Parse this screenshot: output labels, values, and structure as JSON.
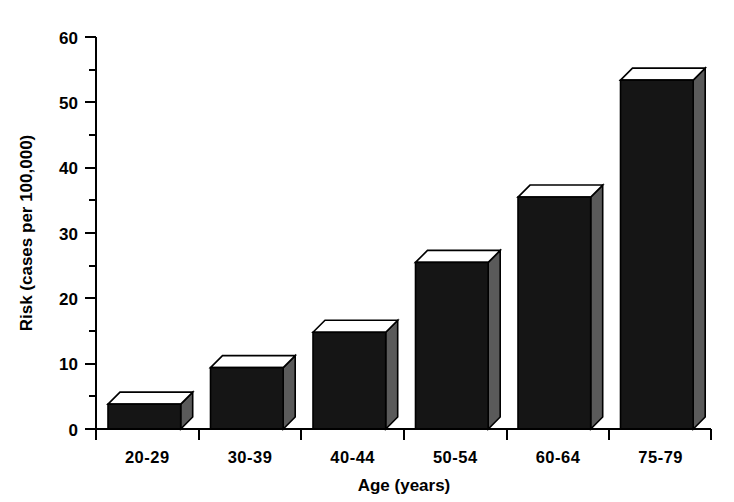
{
  "chart_data": {
    "type": "bar",
    "title": "",
    "subtitle": "",
    "xlabel": "Age  (years)",
    "ylabel": "Risk (cases per 100,000)",
    "categories": [
      "20-29",
      "30-39",
      "40-44",
      "50-54",
      "60-64",
      "75-79"
    ],
    "values": [
      3.8,
      9.4,
      14.8,
      25.5,
      35.5,
      53.4
    ],
    "series": [
      {
        "name": "Risk",
        "values": [
          3.8,
          9.4,
          14.8,
          25.5,
          35.5,
          53.4
        ]
      }
    ],
    "ylim": [
      0,
      60
    ],
    "y_ticks": [
      0,
      10,
      20,
      30,
      40,
      50,
      60
    ],
    "y_tick_labels": [
      "0",
      "10",
      "20",
      "30",
      "40",
      "50",
      "60"
    ],
    "y_minor_ticks": [
      5,
      15,
      25,
      35,
      45,
      55
    ],
    "grid": false,
    "legend": false,
    "legend_position": "none",
    "style": "3d-bars-monochrome",
    "colors": {
      "bar_front": "#151515",
      "bar_top": "#ffffff",
      "bar_side": "#5a5a5a",
      "axis": "#000000",
      "background": "#ffffff"
    }
  }
}
